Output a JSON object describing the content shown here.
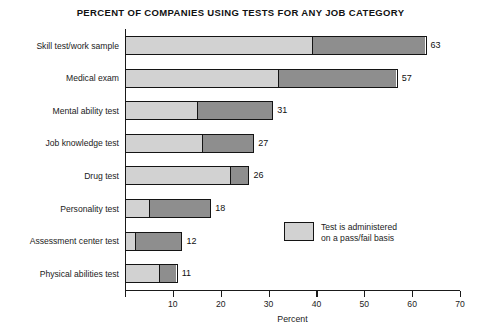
{
  "chart_data": {
    "type": "bar",
    "orientation": "horizontal",
    "stacked": true,
    "title": "PERCENT OF COMPANIES USING TESTS FOR ANY JOB CATEGORY",
    "xlabel": "Percent",
    "ylabel": "",
    "xlim": [
      0,
      70
    ],
    "xticks": [
      0,
      10,
      20,
      30,
      40,
      50,
      60,
      70
    ],
    "xtick_labels": [
      "",
      "10",
      "20",
      "30",
      "40",
      "50",
      "60",
      "70"
    ],
    "grid": false,
    "legend_position": "inside-right",
    "categories": [
      "Skill test/work sample",
      "Medical exam",
      "Mental ability test",
      "Job knowledge test",
      "Drug test",
      "Personality test",
      "Assessment center test",
      "Physical abilities test"
    ],
    "values": [
      63,
      57,
      31,
      27,
      26,
      18,
      12,
      11
    ],
    "value_labels": [
      "63",
      "57",
      "31",
      "27",
      "26",
      "18",
      "12",
      "11"
    ],
    "series": [
      {
        "name": "Test is administered on a pass/fail basis",
        "color": "#d2d2d2",
        "values": [
          39,
          32,
          15,
          16,
          22,
          5,
          2,
          7
        ]
      },
      {
        "name": "Other basis",
        "color": "#8e8e8e",
        "values": [
          24,
          25,
          16,
          11,
          4,
          13,
          10,
          4
        ]
      }
    ],
    "legend": {
      "swatch_color": "#d2d2d2",
      "line1": "Test is administered",
      "line2": "on a pass/fail basis"
    },
    "colors": {
      "light_segment": "#d2d2d2",
      "dark_segment": "#8e8e8e",
      "axis": "#1a1a1a",
      "text": "#1b1b1b",
      "background": "#ffffff"
    }
  }
}
